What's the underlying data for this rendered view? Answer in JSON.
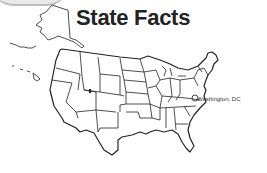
{
  "header": {
    "title": "State Facts"
  },
  "map": {
    "region": "United States",
    "labels": {
      "capital": "Washington, DC"
    },
    "colors": {
      "outline": "#222222",
      "background": "#ffffff"
    }
  }
}
